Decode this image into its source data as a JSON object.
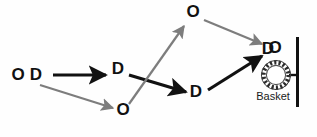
{
  "diagram": {
    "type": "basketball-play-diagram",
    "background_color": "#fefefe",
    "cut_arrow_color": "#7d7d7d",
    "pass_arrow_color": "#111111",
    "marker_color": "#111111",
    "markers": [
      {
        "id": "o-start",
        "label": "O",
        "x": 18,
        "y": 76
      },
      {
        "id": "d-start",
        "label": "D",
        "x": 36,
        "y": 76
      },
      {
        "id": "d-wing",
        "label": "D",
        "x": 118,
        "y": 70
      },
      {
        "id": "o-top",
        "label": "O",
        "x": 193,
        "y": 13
      },
      {
        "id": "o-corner",
        "label": "O",
        "x": 123,
        "y": 111
      },
      {
        "id": "d-low",
        "label": "D",
        "x": 196,
        "y": 93
      },
      {
        "id": "d-basket",
        "label": "D",
        "x": 268,
        "y": 50
      },
      {
        "id": "o-basket",
        "label": "O",
        "x": 274,
        "y": 49
      }
    ],
    "arrows": [
      {
        "id": "pass-start-to-wing",
        "style": "pass",
        "color": "#111111",
        "x1": 53,
        "y1": 75,
        "x2": 106,
        "y2": 75
      },
      {
        "id": "cut-start-to-corner",
        "style": "cut",
        "color": "#7d7d7d",
        "x1": 40,
        "y1": 85,
        "x2": 113,
        "y2": 108
      },
      {
        "id": "pass-wing-to-low",
        "style": "pass",
        "color": "#111111",
        "x1": 129,
        "y1": 75,
        "x2": 186,
        "y2": 92
      },
      {
        "id": "cut-corner-to-top",
        "style": "cut",
        "color": "#7d7d7d",
        "x1": 129,
        "y1": 104,
        "x2": 184,
        "y2": 26
      },
      {
        "id": "cut-top-to-basket",
        "style": "cut",
        "color": "#7d7d7d",
        "x1": 204,
        "y1": 20,
        "x2": 262,
        "y2": 44
      },
      {
        "id": "pass-low-to-basket",
        "style": "pass",
        "color": "#111111",
        "x1": 208,
        "y1": 90,
        "x2": 262,
        "y2": 56
      }
    ],
    "basket": {
      "label": "Basket",
      "label_x": 273,
      "label_y": 97,
      "hoop": {
        "cx": 276,
        "cy": 75,
        "r": 13,
        "ring_color": "#2b2b2b",
        "fill": "#ffffff"
      },
      "backboard": {
        "x": 297,
        "y1": 37,
        "y2": 107,
        "color": "#111111",
        "width": 3
      },
      "connector": {
        "x1": 289,
        "y1": 75,
        "x2": 297,
        "y2": 75,
        "color": "#111111"
      }
    }
  }
}
